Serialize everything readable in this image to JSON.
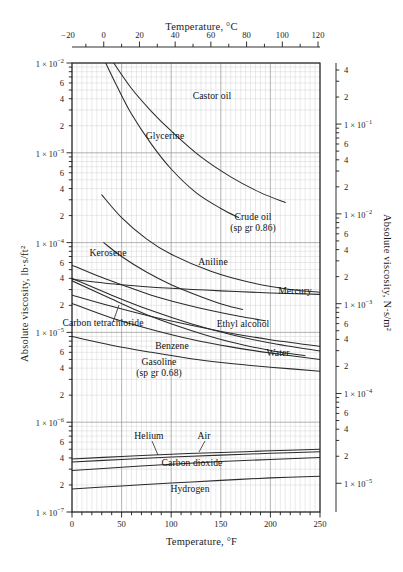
{
  "figure": {
    "title_top": "Temperature, °C",
    "title_bottom": "Temperature, °F",
    "title_left": "Absolute viscosity, lb·s/ft²",
    "title_right": "Absolute viscosity, N·s/m²",
    "caption": ""
  },
  "chart_data": {
    "type": "line",
    "xlabel": "Temperature, °F",
    "ylabel": "Absolute viscosity, lb·s/ft²",
    "xlabel_secondary": "Temperature, °C",
    "ylabel_secondary": "Absolute viscosity, N·s/m²",
    "xscale": "linear",
    "yscale": "log",
    "xlim": [
      0,
      250
    ],
    "ylim": [
      1e-07,
      0.01
    ],
    "xlim_secondary_c": [
      -17.8,
      121.1
    ],
    "ylim_secondary": [
      1e-05,
      0.479
    ],
    "grid": true,
    "legend": "inline-curve-labels",
    "x_ticks_f": [
      0,
      50,
      100,
      150,
      200,
      250
    ],
    "x_ticks_c": [
      -20,
      0,
      20,
      40,
      60,
      80,
      100,
      120
    ],
    "y_decade_labels_left": [
      "1 × 10⁻²",
      "1 × 10⁻³",
      "1 × 10⁻⁴",
      "1 × 10⁻⁵",
      "1 × 10⁻⁶",
      "1 × 10⁻⁷"
    ],
    "y_minor_labels": [
      "6",
      "4",
      "2"
    ],
    "y_decade_labels_right": [
      "1 × 10⁻¹",
      "1 × 10⁻²",
      "1 × 10⁻³",
      "1 × 10⁻⁴",
      "1 × 10⁻⁵"
    ],
    "y_right_minor_labels": [
      "4",
      "2",
      "6",
      "4",
      "2"
    ],
    "unit_conversion_note": "1 lb·s/ft² = 47.88 N·s/m²",
    "series": [
      {
        "name": "Castor oil",
        "label": "Castor oil",
        "points": [
          [
            42,
            0.01
          ],
          [
            60,
            0.0052
          ],
          [
            80,
            0.0029
          ],
          [
            100,
            0.00175
          ],
          [
            130,
            0.0009
          ],
          [
            160,
            0.00054
          ],
          [
            190,
            0.00036
          ],
          [
            215,
            0.00028
          ]
        ]
      },
      {
        "name": "Glycerine",
        "label": "Glycerine",
        "points": [
          [
            34,
            0.01
          ],
          [
            45,
            0.0056
          ],
          [
            60,
            0.0027
          ],
          [
            80,
            0.00125
          ],
          [
            100,
            0.00066
          ],
          [
            125,
            0.00036
          ],
          [
            150,
            0.00024
          ],
          [
            168,
            0.00019
          ]
        ]
      },
      {
        "name": "Crude oil (sp gr 0.86)",
        "label": "Crude oil",
        "sublabel": "(sp gr 0.86)",
        "points": [
          [
            30,
            0.00034
          ],
          [
            50,
            0.00019
          ],
          [
            75,
            0.00011
          ],
          [
            100,
            7.4e-05
          ],
          [
            140,
            4.8e-05
          ],
          [
            180,
            3.6e-05
          ],
          [
            220,
            3e-05
          ],
          [
            250,
            2.8e-05
          ]
        ]
      },
      {
        "name": "Aniline",
        "label": "Aniline",
        "points": [
          [
            32,
            0.0001
          ],
          [
            50,
            7e-05
          ],
          [
            75,
            4.7e-05
          ],
          [
            100,
            3.4e-05
          ],
          [
            130,
            2.5e-05
          ],
          [
            155,
            2e-05
          ],
          [
            172,
            1.8e-05
          ]
        ]
      },
      {
        "name": "Kerosene",
        "label": "Kerosene",
        "points": [
          [
            0,
            5.6e-05
          ],
          [
            25,
            4.3e-05
          ],
          [
            50,
            3.4e-05
          ],
          [
            80,
            2.6e-05
          ],
          [
            110,
            2.1e-05
          ],
          [
            140,
            1.75e-05
          ],
          [
            170,
            1.5e-05
          ],
          [
            195,
            1.35e-05
          ]
        ]
      },
      {
        "name": "Mercury",
        "label": "Mercury",
        "points": [
          [
            0,
            3.9e-05
          ],
          [
            50,
            3.4e-05
          ],
          [
            100,
            3.1e-05
          ],
          [
            150,
            2.9e-05
          ],
          [
            200,
            2.75e-05
          ],
          [
            250,
            2.65e-05
          ]
        ]
      },
      {
        "name": "Carbon tetrachloride",
        "label": "Carbon tetrachloride",
        "points": [
          [
            0,
            2.6e-05
          ],
          [
            40,
            1.95e-05
          ],
          [
            80,
            1.5e-05
          ],
          [
            120,
            1.2e-05
          ],
          [
            160,
            9.8e-06
          ],
          [
            200,
            8.3e-06
          ],
          [
            250,
            7e-06
          ]
        ]
      },
      {
        "name": "Ethyl alcohol",
        "label": "Ethyl alcohol",
        "points": [
          [
            0,
            4e-05
          ],
          [
            40,
            2.6e-05
          ],
          [
            80,
            1.75e-05
          ],
          [
            120,
            1.25e-05
          ],
          [
            160,
            9.5e-06
          ],
          [
            200,
            7.6e-06
          ],
          [
            250,
            6.2e-06
          ]
        ]
      },
      {
        "name": "Benzene",
        "label": "Benzene",
        "points": [
          [
            0,
            2.1e-05
          ],
          [
            40,
            1.45e-05
          ],
          [
            80,
            1.08e-05
          ],
          [
            120,
            8.4e-06
          ],
          [
            160,
            6.9e-06
          ],
          [
            200,
            5.9e-06
          ],
          [
            250,
            5e-06
          ]
        ]
      },
      {
        "name": "Water",
        "label": "Water",
        "points": [
          [
            0,
            3.75e-05
          ],
          [
            40,
            2.35e-05
          ],
          [
            80,
            1.5e-05
          ],
          [
            120,
            1.05e-05
          ],
          [
            160,
            7.8e-06
          ],
          [
            200,
            6.3e-06
          ],
          [
            235,
            5.5e-06
          ]
        ]
      },
      {
        "name": "Gasoline (sp gr 0.68)",
        "label": "Gasoline",
        "sublabel": "(sp gr 0.68)",
        "points": [
          [
            0,
            9e-06
          ],
          [
            40,
            7.2e-06
          ],
          [
            80,
            6e-06
          ],
          [
            120,
            5.1e-06
          ],
          [
            160,
            4.5e-06
          ],
          [
            200,
            4.1e-06
          ],
          [
            250,
            3.7e-06
          ]
        ]
      },
      {
        "name": "Helium",
        "label": "Helium",
        "points": [
          [
            0,
            3.9e-07
          ],
          [
            50,
            4.15e-07
          ],
          [
            100,
            4.4e-07
          ],
          [
            150,
            4.6e-07
          ],
          [
            200,
            4.8e-07
          ],
          [
            250,
            5e-07
          ]
        ]
      },
      {
        "name": "Air",
        "label": "Air",
        "points": [
          [
            0,
            3.6e-07
          ],
          [
            50,
            3.85e-07
          ],
          [
            100,
            4.1e-07
          ],
          [
            150,
            4.3e-07
          ],
          [
            200,
            4.5e-07
          ],
          [
            250,
            4.7e-07
          ]
        ]
      },
      {
        "name": "Carbon dioxide",
        "label": "Carbon dioxide",
        "points": [
          [
            0,
            2.9e-07
          ],
          [
            50,
            3.15e-07
          ],
          [
            100,
            3.4e-07
          ],
          [
            150,
            3.65e-07
          ],
          [
            200,
            3.85e-07
          ],
          [
            250,
            4.05e-07
          ]
        ]
      },
      {
        "name": "Hydrogen",
        "label": "Hydrogen",
        "points": [
          [
            0,
            1.8e-07
          ],
          [
            50,
            1.95e-07
          ],
          [
            100,
            2.1e-07
          ],
          [
            150,
            2.25e-07
          ],
          [
            200,
            2.4e-07
          ],
          [
            250,
            2.5e-07
          ]
        ]
      }
    ]
  }
}
